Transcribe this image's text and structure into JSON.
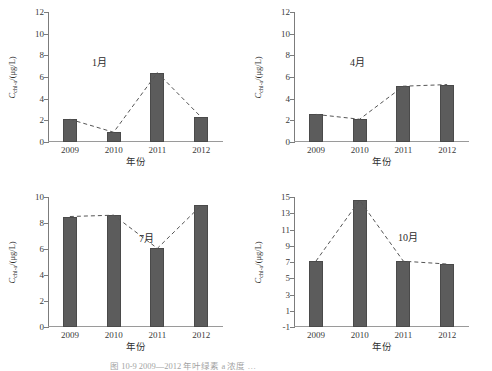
{
  "figure": {
    "axis_x_title": "年份",
    "axis_y_symbol": "C",
    "axis_y_subscript": "chl-a",
    "axis_y_unit": "/(μg/L)",
    "bar_color": "#5c5c5c",
    "trend_color": "#555555",
    "axis_color": "#7c7c7c",
    "caption": "图 10-9   2009—2012 年叶绿素 a 浓度 …"
  },
  "chart_data": [
    {
      "type": "bar",
      "panel": "top-left",
      "title": "1月",
      "xlabel": "年份",
      "ylabel": "C_chl-a /(μg/L)",
      "categories": [
        "2009",
        "2010",
        "2011",
        "2012"
      ],
      "values": [
        2.1,
        0.9,
        6.4,
        2.3
      ],
      "yticks": [
        0,
        2,
        4,
        6,
        8,
        10,
        12
      ],
      "ylim": [
        0,
        12
      ],
      "grid": false,
      "series": [
        {
          "name": "叶绿素a浓度",
          "values": [
            2.1,
            0.9,
            6.4,
            2.3
          ]
        }
      ],
      "overlay": {
        "type": "line",
        "style": "dashed",
        "values": [
          2.1,
          0.9,
          6.4,
          2.3
        ]
      }
    },
    {
      "type": "bar",
      "panel": "top-right",
      "title": "4月",
      "xlabel": "年份",
      "ylabel": "C_chl-a /(μg/L)",
      "categories": [
        "2009",
        "2010",
        "2011",
        "2012"
      ],
      "values": [
        2.55,
        2.1,
        5.15,
        5.3
      ],
      "yticks": [
        0,
        2,
        4,
        6,
        8,
        10,
        12
      ],
      "ylim": [
        0,
        12
      ],
      "grid": false,
      "series": [
        {
          "name": "叶绿素a浓度",
          "values": [
            2.55,
            2.1,
            5.15,
            5.3
          ]
        }
      ],
      "overlay": {
        "type": "line",
        "style": "dashed",
        "values": [
          2.55,
          2.1,
          5.15,
          5.3
        ]
      }
    },
    {
      "type": "bar",
      "panel": "bottom-left",
      "title": "7月",
      "xlabel": "年份",
      "ylabel": "C_chl-a /(μg/L)",
      "categories": [
        "2009",
        "2010",
        "2011",
        "2012"
      ],
      "values": [
        8.5,
        8.6,
        6.05,
        9.35
      ],
      "yticks": [
        0,
        2,
        4,
        6,
        8,
        10
      ],
      "ylim": [
        0,
        10
      ],
      "grid": false,
      "series": [
        {
          "name": "叶绿素a浓度",
          "values": [
            8.5,
            8.6,
            6.05,
            9.35
          ]
        }
      ],
      "overlay": {
        "type": "line",
        "style": "dashed",
        "values": [
          8.5,
          8.6,
          6.05,
          9.35
        ]
      }
    },
    {
      "type": "bar",
      "panel": "bottom-right",
      "title": "10月",
      "xlabel": "年份",
      "ylabel": "C_chl-a /(μg/L)",
      "categories": [
        "2009",
        "2010",
        "2011",
        "2012"
      ],
      "values": [
        7.1,
        14.6,
        7.1,
        6.75
      ],
      "yticks": [
        -1,
        1,
        3,
        5,
        7,
        9,
        11,
        13,
        15
      ],
      "ylim": [
        -1,
        15
      ],
      "grid": false,
      "series": [
        {
          "name": "叶绿素a浓度",
          "values": [
            7.1,
            14.6,
            7.1,
            6.75
          ]
        }
      ],
      "overlay": {
        "type": "line",
        "style": "dashed",
        "values": [
          7.1,
          14.6,
          7.1,
          6.75
        ]
      }
    }
  ]
}
